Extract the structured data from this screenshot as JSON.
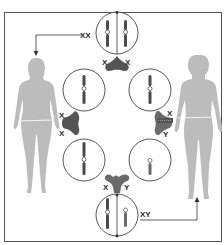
{
  "diagram": {
    "title": "",
    "colors": {
      "frame": "#555555",
      "line": "#333333",
      "chromosome": "#4a4a4a",
      "chromosome_y": "#6a6a6a",
      "connector": "#555555",
      "silhouette": "#b9b9b9"
    },
    "figures": [
      {
        "id": "female",
        "label": "female-silhouette"
      },
      {
        "id": "male",
        "label": "male-silhouette"
      }
    ],
    "cells": [
      {
        "id": "top",
        "genotype": "XX",
        "label": "XX",
        "chromosomes": [
          "X",
          "X"
        ]
      },
      {
        "id": "upper-left",
        "chromosomes": [
          "X"
        ]
      },
      {
        "id": "upper-right",
        "chromosomes": [
          "X"
        ]
      },
      {
        "id": "lower-left",
        "chromosomes": [
          "X"
        ]
      },
      {
        "id": "lower-right",
        "chromosomes": [
          "Y"
        ]
      },
      {
        "id": "bottom",
        "genotype": "XY",
        "label": "XY",
        "chromosomes": [
          "X",
          "Y"
        ]
      }
    ],
    "connectors": [
      {
        "id": "top",
        "left_label": "X",
        "right_label": "X"
      },
      {
        "id": "left",
        "top_label": "X",
        "bottom_label": "X"
      },
      {
        "id": "right",
        "top_label": "X",
        "bottom_label": "Y"
      },
      {
        "id": "bottom",
        "left_label": "X",
        "right_label": "Y"
      }
    ],
    "arrows": [
      {
        "from": "top",
        "to": "female",
        "label": "XX"
      },
      {
        "from": "bottom",
        "to": "male",
        "label": "XY"
      }
    ]
  }
}
